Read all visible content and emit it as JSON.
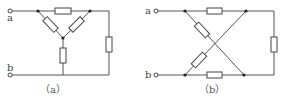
{
  "diagram": {
    "type": "circuit-schematic",
    "panels": [
      {
        "id": "a",
        "caption": "（a）",
        "terminals": [
          {
            "label": "a"
          },
          {
            "label": "b"
          }
        ],
        "description": "Y (star) network of three resistors between top rail and bottom rail, with a resistor on the top rail and one on the right side"
      },
      {
        "id": "b",
        "caption": "（b）",
        "terminals": [
          {
            "label": "a"
          },
          {
            "label": "b"
          }
        ],
        "description": "Bridge network with crossing diagonal resistors, top and bottom rail resistors and a right-side resistor"
      }
    ],
    "colors": {
      "line": "#555555",
      "background": "#ffffff"
    }
  }
}
